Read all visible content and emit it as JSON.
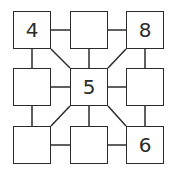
{
  "puzzle": {
    "cells": [
      {
        "row": 0,
        "col": 0,
        "value": "4"
      },
      {
        "row": 0,
        "col": 1,
        "value": ""
      },
      {
        "row": 0,
        "col": 2,
        "value": "8"
      },
      {
        "row": 1,
        "col": 0,
        "value": ""
      },
      {
        "row": 1,
        "col": 1,
        "value": "5"
      },
      {
        "row": 1,
        "col": 2,
        "value": ""
      },
      {
        "row": 2,
        "col": 0,
        "value": ""
      },
      {
        "row": 2,
        "col": 1,
        "value": ""
      },
      {
        "row": 2,
        "col": 2,
        "value": "6"
      }
    ],
    "line_color": "#2b2b2b"
  }
}
